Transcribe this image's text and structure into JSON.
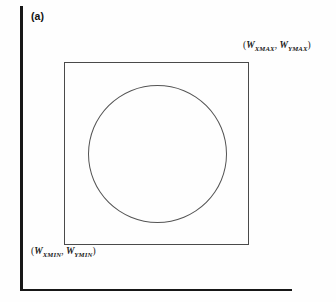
{
  "figure": {
    "panel_label": "(a)",
    "caption_parts": {
      "open_paren": "(",
      "comma_space": ", ",
      "close_paren": ")"
    }
  },
  "labels": {
    "max_corner": {
      "text": "(WXMAX, WYMAX)",
      "x_var": "W",
      "x_sub": "XMAX",
      "y_var": "W",
      "y_sub": "YMAX"
    },
    "min_corner": {
      "text": "(WXMIN, WYMIN)",
      "x_var": "W",
      "x_sub": "XMIN",
      "y_var": "W",
      "y_sub": "YMIN"
    }
  },
  "shapes": {
    "window_rect_name": "world-coordinate-window",
    "circle_name": "circle-object",
    "y_axis_name": "y-axis",
    "x_axis_name": "x-axis"
  },
  "colors": {
    "axis": "#171717",
    "rect_stroke": "#4a4a4a",
    "circle_stroke": "#545454",
    "background": "#fefefe",
    "text": "#1a1a1a"
  },
  "chart_data": {
    "type": "diagram",
    "title": "(a)",
    "axes": {
      "x_axis": {
        "from": [
          20,
          289
        ],
        "to": [
          292,
          289
        ],
        "label": ""
      },
      "y_axis": {
        "from": [
          20,
          6
        ],
        "to": [
          20,
          291
        ],
        "label": ""
      },
      "origin": [
        20,
        289
      ]
    },
    "elements": [
      {
        "name": "world-coordinate-window",
        "shape": "rectangle",
        "x": 64,
        "y": 62,
        "width": 185,
        "height": 183,
        "corner_min_label": "(WXMIN, WYMIN)",
        "corner_max_label": "(WXMAX, WYMAX)"
      },
      {
        "name": "circle-object",
        "shape": "circle",
        "center": [
          157.5,
          154
        ],
        "radius": 69.5
      }
    ],
    "annotations": [
      {
        "text": "(a)",
        "position": [
          31,
          10
        ],
        "style": "bold-sans"
      },
      {
        "text": "(WXMAX, WYMAX)",
        "position": [
          243,
          41
        ],
        "style": "italic-serif"
      },
      {
        "text": "(WXMIN, WYMIN)",
        "position": [
          31,
          247
        ],
        "style": "italic-serif"
      }
    ],
    "grid": false,
    "legend": null
  }
}
